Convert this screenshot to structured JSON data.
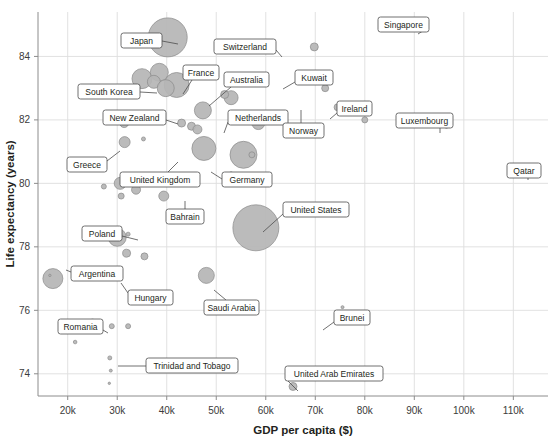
{
  "chart_data": {
    "type": "scatter",
    "title": "",
    "xlabel": "GDP per capita ($)",
    "ylabel": "Life expectancy (years)",
    "xlim": [
      14000,
      117000
    ],
    "ylim": [
      73.3,
      85.4
    ],
    "xticks": [
      20000,
      30000,
      40000,
      50000,
      60000,
      70000,
      80000,
      90000,
      100000,
      110000
    ],
    "xticklabels": [
      "20k",
      "30k",
      "40k",
      "50k",
      "60k",
      "70k",
      "80k",
      "90k",
      "100k",
      "110k"
    ],
    "yticks": [
      74,
      76,
      78,
      80,
      82,
      84
    ],
    "yticklabels": [
      "74",
      "76",
      "78",
      "80",
      "82",
      "84"
    ],
    "grid": true,
    "legend": "none",
    "size_encoding": "population",
    "points": [
      {
        "label": "Japan",
        "x": 40200,
        "y": 84.6,
        "r": 19.5,
        "labeled": true,
        "box": {
          "x": 121,
          "y": 33,
          "w": 41,
          "h": 15
        },
        "leader": [
          [
            162,
            41
          ],
          [
            178,
            44
          ]
        ]
      },
      {
        "label": "Switzerland",
        "x": 69800,
        "y": 84.3,
        "r": 4.0,
        "labeled": true,
        "box": {
          "x": 214,
          "y": 39,
          "w": 62,
          "h": 15
        },
        "leader": [
          [
            276,
            50
          ],
          [
            282,
            57
          ]
        ]
      },
      {
        "label": "Singapore",
        "x": 90400,
        "y": 85.0,
        "r": 4.5,
        "labeled": true,
        "box": {
          "x": 378,
          "y": 17,
          "w": 51,
          "h": 15
        },
        "leader": [
          [
            429,
            27
          ],
          [
            418,
            34
          ]
        ]
      },
      {
        "label": "South Korea",
        "x": 35000,
        "y": 83.3,
        "r": 10.0,
        "labeled": true,
        "box": {
          "x": 78,
          "y": 84,
          "w": 62,
          "h": 15
        },
        "leader": [
          [
            140,
            92
          ],
          [
            157,
            93
          ]
        ]
      },
      {
        "label": "France",
        "x": 42000,
        "y": 83.1,
        "r": 12.5,
        "labeled": true,
        "box": {
          "x": 183,
          "y": 65,
          "w": 36,
          "h": 15
        },
        "leader": [
          [
            192,
            80
          ],
          [
            183,
            94
          ]
        ]
      },
      {
        "label": "Australia",
        "x": 53000,
        "y": 82.7,
        "r": 7.0,
        "labeled": true,
        "box": {
          "x": 224,
          "y": 72,
          "w": 45,
          "h": 15
        },
        "leader": [
          [
            231,
            87
          ],
          [
            209,
            106
          ]
        ]
      },
      {
        "label": "New Zealand",
        "x": 43000,
        "y": 81.9,
        "r": 4.0,
        "labeled": true,
        "box": {
          "x": 103,
          "y": 110,
          "w": 63,
          "h": 15
        },
        "leader": [
          [
            166,
            120
          ],
          [
            178,
            124
          ]
        ]
      },
      {
        "label": "Netherlands",
        "x": 58500,
        "y": 81.9,
        "r": 6.5,
        "labeled": true,
        "box": {
          "x": 228,
          "y": 110,
          "w": 60,
          "h": 15
        },
        "leader": [
          [
            228,
            122
          ],
          [
            224,
            133
          ]
        ]
      },
      {
        "label": "Kuwait",
        "x": 72000,
        "y": 83.0,
        "r": 3.5,
        "labeled": true,
        "box": {
          "x": 295,
          "y": 70,
          "w": 38,
          "h": 15
        },
        "leader": [
          [
            295,
            82
          ],
          [
            283,
            89
          ]
        ]
      },
      {
        "label": "Norway",
        "x": 74500,
        "y": 82.4,
        "r": 3.5,
        "labeled": true,
        "box": {
          "x": 283,
          "y": 123,
          "w": 41,
          "h": 15
        },
        "leader": [
          [
            301,
            123
          ],
          [
            301,
            110
          ]
        ]
      },
      {
        "label": "Ireland",
        "x": 80000,
        "y": 82.0,
        "r": 3.0,
        "labeled": true,
        "box": {
          "x": 337,
          "y": 101,
          "w": 35,
          "h": 15
        },
        "leader": [
          [
            337,
            113
          ],
          [
            330,
            119
          ]
        ]
      },
      {
        "label": "Luxembourg",
        "x": 96500,
        "y": 81.8,
        "r": 2.0,
        "labeled": true,
        "box": {
          "x": 396,
          "y": 113,
          "w": 57,
          "h": 15
        },
        "leader": [
          [
            440,
            128
          ],
          [
            440,
            133
          ]
        ]
      },
      {
        "label": "Qatar",
        "x": 114000,
        "y": 80.5,
        "r": 3.0,
        "labeled": true,
        "box": {
          "x": 507,
          "y": 163,
          "w": 34,
          "h": 15
        },
        "leader": [
          [
            528,
            178
          ],
          [
            528,
            180
          ]
        ]
      },
      {
        "label": "Greece",
        "x": 31500,
        "y": 81.3,
        "r": 5.5,
        "labeled": true,
        "box": {
          "x": 67,
          "y": 157,
          "w": 40,
          "h": 15
        },
        "leader": [
          [
            107,
            161
          ],
          [
            120,
            151
          ]
        ]
      },
      {
        "label": "United Kingdom",
        "x": 47500,
        "y": 81.1,
        "r": 12.0,
        "labeled": true,
        "box": {
          "x": 120,
          "y": 172,
          "w": 80,
          "h": 15
        },
        "leader": [
          [
            168,
            172
          ],
          [
            178,
            162
          ]
        ]
      },
      {
        "label": "Germany",
        "x": 55500,
        "y": 80.9,
        "r": 13.5,
        "labeled": true,
        "box": {
          "x": 222,
          "y": 172,
          "w": 50,
          "h": 15
        },
        "leader": [
          [
            222,
            179
          ],
          [
            211,
            172
          ]
        ]
      },
      {
        "label": "Bahrain",
        "x": 53000,
        "y": 80.3,
        "r": 2.0,
        "labeled": true,
        "box": {
          "x": 166,
          "y": 209,
          "w": 38,
          "h": 15
        },
        "leader": [
          [
            185,
            209
          ],
          [
            185,
            201
          ]
        ]
      },
      {
        "label": "United States",
        "x": 58000,
        "y": 78.6,
        "r": 23.0,
        "labeled": true,
        "box": {
          "x": 283,
          "y": 202,
          "w": 66,
          "h": 15
        },
        "leader": [
          [
            283,
            214
          ],
          [
            263,
            232
          ]
        ]
      },
      {
        "label": "Poland",
        "x": 30000,
        "y": 78.3,
        "r": 9.0,
        "labeled": true,
        "box": {
          "x": 82,
          "y": 226,
          "w": 40,
          "h": 15
        },
        "leader": [
          [
            122,
            236
          ],
          [
            138,
            240
          ]
        ]
      },
      {
        "label": "Argentina",
        "x": 17000,
        "y": 77.0,
        "r": 10.0,
        "labeled": true,
        "box": {
          "x": 71,
          "y": 266,
          "w": 52,
          "h": 15
        },
        "leader": [
          [
            71,
            272
          ],
          [
            66,
            270
          ]
        ]
      },
      {
        "label": "Hungary",
        "x": 29500,
        "y": 77.2,
        "r": 4.5,
        "labeled": true,
        "box": {
          "x": 128,
          "y": 290,
          "w": 45,
          "h": 15
        },
        "leader": [
          [
            128,
            293
          ],
          [
            121,
            283
          ]
        ]
      },
      {
        "label": "Saudi Arabia",
        "x": 48000,
        "y": 77.1,
        "r": 8.0,
        "labeled": true,
        "box": {
          "x": 204,
          "y": 300,
          "w": 55,
          "h": 15
        },
        "leader": [
          [
            226,
            300
          ],
          [
            214,
            290
          ]
        ]
      },
      {
        "label": "Romania",
        "x": 25000,
        "y": 75.5,
        "r": 7.0,
        "labeled": true,
        "box": {
          "x": 58,
          "y": 319,
          "w": 45,
          "h": 15
        },
        "leader": [
          [
            103,
            330
          ],
          [
            108,
            333
          ]
        ]
      },
      {
        "label": "Brunei",
        "x": 75500,
        "y": 76.1,
        "r": 1.5,
        "labeled": true,
        "box": {
          "x": 334,
          "y": 310,
          "w": 36,
          "h": 15
        },
        "leader": [
          [
            334,
            322
          ],
          [
            323,
            330
          ]
        ]
      },
      {
        "label": "Trinidad and Tobago",
        "x": 28500,
        "y": 74.5,
        "r": 2.0,
        "labeled": true,
        "box": {
          "x": 146,
          "y": 358,
          "w": 92,
          "h": 15
        },
        "leader": [
          [
            146,
            366
          ],
          [
            118,
            366
          ]
        ]
      },
      {
        "label": "United Arab Emirates",
        "x": 65500,
        "y": 73.6,
        "r": 4.0,
        "labeled": true,
        "box": {
          "x": 285,
          "y": 366,
          "w": 98,
          "h": 15
        },
        "leader": [
          [
            285,
            378
          ],
          [
            298,
            391
          ]
        ]
      },
      {
        "label": "",
        "x": 38500,
        "y": 83.5,
        "r": 9.0,
        "labeled": false
      },
      {
        "label": "",
        "x": 37400,
        "y": 83.2,
        "r": 6.5,
        "labeled": false
      },
      {
        "label": "",
        "x": 39800,
        "y": 83.0,
        "r": 8.5,
        "labeled": false
      },
      {
        "label": "",
        "x": 51700,
        "y": 82.8,
        "r": 4.0,
        "labeled": false
      },
      {
        "label": "",
        "x": 47300,
        "y": 82.3,
        "r": 8.5,
        "labeled": false
      },
      {
        "label": "",
        "x": 54000,
        "y": 82.1,
        "r": 4.5,
        "labeled": false
      },
      {
        "label": "",
        "x": 45000,
        "y": 81.8,
        "r": 4.0,
        "labeled": false
      },
      {
        "label": "",
        "x": 46200,
        "y": 81.7,
        "r": 4.5,
        "labeled": false
      },
      {
        "label": "",
        "x": 31400,
        "y": 81.9,
        "r": 4.5,
        "labeled": false
      },
      {
        "label": "",
        "x": 57200,
        "y": 80.9,
        "r": 3.0,
        "labeled": false
      },
      {
        "label": "",
        "x": 35300,
        "y": 81.4,
        "r": 2.0,
        "labeled": false
      },
      {
        "label": "",
        "x": 30600,
        "y": 80.0,
        "r": 6.0,
        "labeled": false
      },
      {
        "label": "",
        "x": 30800,
        "y": 79.6,
        "r": 3.0,
        "labeled": false
      },
      {
        "label": "",
        "x": 39400,
        "y": 79.6,
        "r": 5.0,
        "labeled": false
      },
      {
        "label": "",
        "x": 27300,
        "y": 79.9,
        "r": 2.5,
        "labeled": false
      },
      {
        "label": "",
        "x": 33800,
        "y": 79.8,
        "r": 4.5,
        "labeled": false
      },
      {
        "label": "",
        "x": 32200,
        "y": 78.4,
        "r": 2.0,
        "labeled": false
      },
      {
        "label": "",
        "x": 31900,
        "y": 77.8,
        "r": 4.0,
        "labeled": false
      },
      {
        "label": "",
        "x": 35500,
        "y": 77.7,
        "r": 3.5,
        "labeled": false
      },
      {
        "label": "",
        "x": 16400,
        "y": 77.1,
        "r": 1.2,
        "labeled": false
      },
      {
        "label": "",
        "x": 28900,
        "y": 75.5,
        "r": 2.5,
        "labeled": false
      },
      {
        "label": "",
        "x": 32200,
        "y": 75.5,
        "r": 2.5,
        "labeled": false
      },
      {
        "label": "",
        "x": 21500,
        "y": 75.0,
        "r": 1.8,
        "labeled": false
      },
      {
        "label": "",
        "x": 28700,
        "y": 74.1,
        "r": 1.5,
        "labeled": false
      },
      {
        "label": "",
        "x": 28400,
        "y": 73.7,
        "r": 1.2,
        "labeled": false
      }
    ]
  },
  "watermark": {
    "text": ""
  }
}
